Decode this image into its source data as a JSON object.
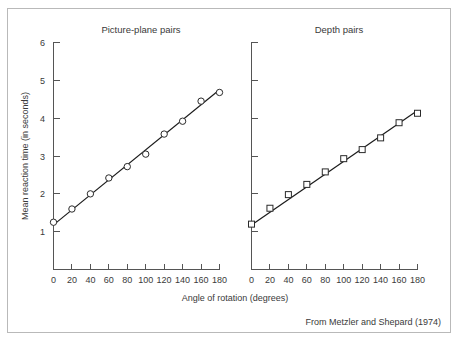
{
  "figure": {
    "caption": "From Metzler and Shepard (1974)",
    "border_color": "#b9b9b9",
    "background": "#ffffff",
    "axis_color": "#555555",
    "line_color": "#1a1a1a",
    "text_color": "#3a3a3a"
  },
  "chart_data": {
    "type": "scatter",
    "title": "",
    "xlabel": "Angle of rotation (degrees)",
    "ylabel": "Mean reaction time (in seconds)",
    "xlim": [
      0,
      180
    ],
    "ylim": [
      0,
      6
    ],
    "xticks": [
      0,
      20,
      40,
      60,
      80,
      100,
      120,
      140,
      160,
      180
    ],
    "yticks": [
      1,
      2,
      3,
      4,
      5,
      6
    ],
    "xtick_labels": [
      "0",
      "20",
      "40",
      "60",
      "80",
      "100",
      "120",
      "140",
      "160",
      "180"
    ],
    "ytick_labels": [
      "1",
      "2",
      "3",
      "4",
      "5",
      "6"
    ],
    "grid": false,
    "legend": "none",
    "panels": [
      {
        "title": "Picture-plane pairs",
        "marker": "circle",
        "x": [
          0,
          20,
          40,
          60,
          80,
          100,
          120,
          140,
          160,
          180
        ],
        "y": [
          1.25,
          1.6,
          2.0,
          2.42,
          2.72,
          3.05,
          3.58,
          3.92,
          4.45,
          4.68
        ],
        "fit_line": {
          "x": [
            0,
            180
          ],
          "y": [
            1.18,
            4.75
          ]
        }
      },
      {
        "title": "Depth pairs",
        "marker": "square",
        "x": [
          0,
          20,
          40,
          60,
          80,
          100,
          120,
          140,
          160,
          180
        ],
        "y": [
          1.2,
          1.62,
          1.98,
          2.25,
          2.58,
          2.93,
          3.17,
          3.48,
          3.88,
          4.13
        ],
        "fit_line": {
          "x": [
            0,
            180
          ],
          "y": [
            1.18,
            4.2
          ]
        }
      }
    ]
  }
}
